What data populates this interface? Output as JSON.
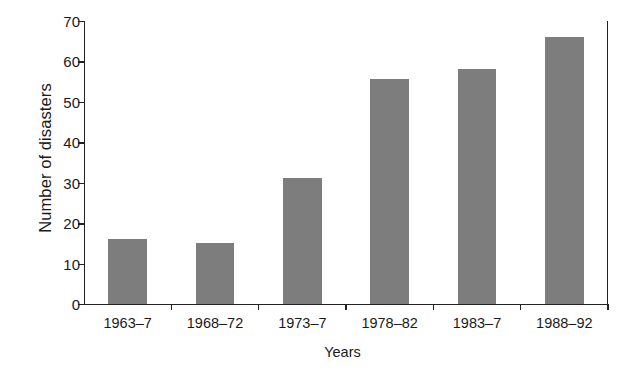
{
  "chart_data": {
    "type": "bar",
    "title": "",
    "xlabel": "Years",
    "ylabel": "Number of disasters",
    "categories": [
      "1963–7",
      "1968–72",
      "1973–7",
      "1978–82",
      "1983–7",
      "1988–92"
    ],
    "values": [
      16,
      15,
      31,
      55.5,
      58,
      66
    ],
    "ylim": [
      0,
      70
    ],
    "yticks": [
      0,
      10,
      20,
      30,
      40,
      50,
      60,
      70
    ],
    "ytick_labels": [
      "0",
      "10",
      "20",
      "30",
      "40",
      "50",
      "60",
      "70"
    ],
    "grid": false,
    "legend": null,
    "bar_color": "#7d7d7d",
    "axis_color": "#222222",
    "background_color": "#ffffff"
  }
}
